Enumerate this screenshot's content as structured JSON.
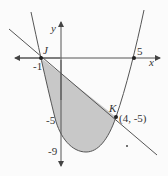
{
  "figure": {
    "axes": {
      "x_label": "x",
      "y_label": "y"
    },
    "points": {
      "J": {
        "label": "J",
        "coord_label": "-1"
      },
      "K": {
        "label": "K",
        "coord_label": "(4, -5)"
      },
      "root": {
        "label": "5"
      }
    },
    "y_ticks": {
      "minus5": "-5",
      "minus9": "-9"
    },
    "colors": {
      "shade": "#c8c8c8",
      "stroke": "#555555",
      "background": "#fbfbfb"
    }
  }
}
